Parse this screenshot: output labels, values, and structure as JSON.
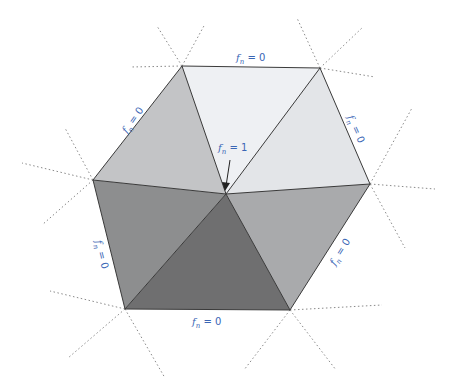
{
  "diagram": {
    "center_label": {
      "symbol": "f",
      "subscript": "n",
      "text": " = 1"
    },
    "edge_labels": [
      {
        "id": "top",
        "symbol": "f",
        "subscript": "n",
        "text": " = 0"
      },
      {
        "id": "upper-right",
        "symbol": "f",
        "subscript": "n",
        "text": " = 0"
      },
      {
        "id": "lower-right",
        "symbol": "f",
        "subscript": "n",
        "text": " = 0"
      },
      {
        "id": "bottom",
        "symbol": "f",
        "subscript": "n",
        "text": " = 0"
      },
      {
        "id": "lower-left",
        "symbol": "f",
        "subscript": "n",
        "text": " = 0"
      },
      {
        "id": "upper-left",
        "symbol": "f",
        "subscript": "n",
        "text": " = 0"
      }
    ],
    "triangle_shades": {
      "top": "#eef0f3",
      "upper-right": "#e3e5e8",
      "lower-right": "#a9aaac",
      "bottom": "#6f6f70",
      "lower-left": "#8d8e8f",
      "upper-left": "#c3c4c6"
    },
    "colors": {
      "label": "#3a66b5",
      "edge": "#3a3a3a",
      "dotted": "#8a8a8a"
    }
  }
}
